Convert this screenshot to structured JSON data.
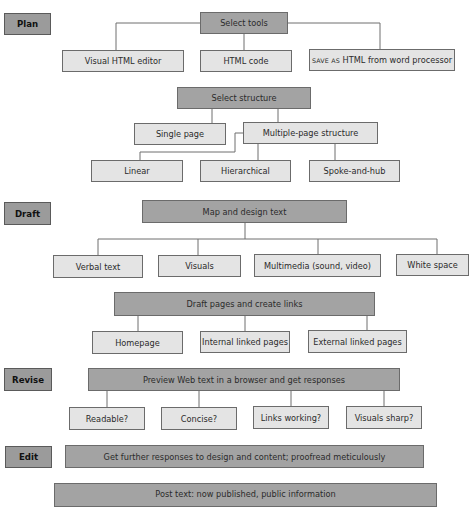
{
  "stages": {
    "plan": "Plan",
    "draft": "Draft",
    "revise": "Revise",
    "edit": "Edit"
  },
  "plan": {
    "select_tools": "Select tools",
    "tools": {
      "visual_editor": "Visual HTML editor",
      "html_code": "HTML code",
      "save_as_prefix": "SAVE AS",
      "save_as_suffix": " HTML from word processor"
    },
    "select_structure": "Select structure",
    "structures": {
      "single_page": "Single page",
      "multiple_page": "Multiple-page structure"
    },
    "multi_types": {
      "linear": "Linear",
      "hierarchical": "Hierarchical",
      "spoke_hub": "Spoke-and-hub"
    }
  },
  "draft": {
    "map_design": "Map and design text",
    "elements": {
      "verbal": "Verbal text",
      "visuals": "Visuals",
      "multimedia": "Multimedia (sound, video)",
      "white_space": "White space"
    },
    "draft_pages": "Draft pages and create links",
    "pages": {
      "homepage": "Homepage",
      "internal": "Internal linked pages",
      "external": "External linked pages"
    }
  },
  "revise": {
    "preview": "Preview Web text in a browser and get responses",
    "checks": {
      "readable": "Readable?",
      "concise": "Concise?",
      "links": "Links working?",
      "visuals_sharp": "Visuals sharp?"
    }
  },
  "edit": {
    "further": "Get further responses to design and content; proofread meticulously"
  },
  "post": {
    "text": "Post text: now published, public information"
  },
  "colors": {
    "dark_box": "#a3a3a3",
    "light_box": "#e4e4e4",
    "stage_box": "#9b9b9b",
    "line": "#6e6e6e"
  }
}
